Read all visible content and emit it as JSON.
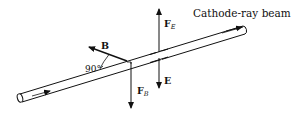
{
  "diagram": {
    "title_label": "Cathode-ray beam",
    "labels": {
      "force_electric": "F",
      "force_electric_sub": "E",
      "force_magnetic": "F",
      "force_magnetic_sub": "B",
      "magnetic_field": "B",
      "electric_field": "E",
      "angle": "90°"
    },
    "colors": {
      "stroke": "#111111",
      "background": "#ffffff"
    }
  }
}
